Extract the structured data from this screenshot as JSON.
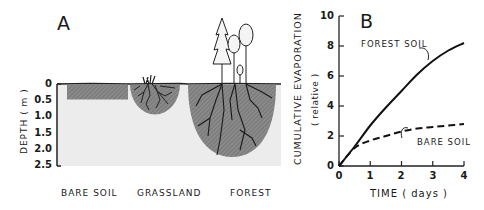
{
  "panel_a": {
    "letter": "A",
    "y_axis_label": "DEPTH",
    "y_axis_unit": "( m )",
    "y_ticks": [
      "0",
      "0.5",
      "1.0",
      "1.5",
      "2.0",
      "2.5"
    ],
    "categories": [
      "BARE SOIL",
      "GRASSLAND",
      "FOREST"
    ],
    "root_depth_m": {
      "BARE SOIL": 0.45,
      "GRASSLAND": 0.9,
      "FOREST": 2.2
    }
  },
  "panel_b": {
    "letter": "B",
    "y_axis_label": "CUMULATIVE EVAPORATION",
    "y_axis_unit": "( relative )",
    "x_axis_label": "TIME ( days )",
    "y_ticks": [
      "0",
      "2",
      "4",
      "6",
      "8",
      "10"
    ],
    "x_ticks": [
      "0",
      "1",
      "2",
      "3",
      "4"
    ],
    "series_labels": [
      "FOREST SOIL",
      "BARE SOIL"
    ]
  },
  "chart_data": [
    {
      "type": "diagram",
      "title": "A",
      "ylabel": "DEPTH (m)",
      "ylim": [
        0,
        2.5
      ],
      "y_ticks": [
        0,
        0.5,
        1.0,
        1.5,
        2.0,
        2.5
      ],
      "categories": [
        "BARE SOIL",
        "GRASSLAND",
        "FOREST"
      ],
      "values": [
        0.45,
        0.9,
        2.2
      ],
      "description": "Depth of soil water extraction zone (shaded) by land cover; roots shown for grassland and forest"
    },
    {
      "type": "line",
      "title": "B",
      "xlabel": "TIME (days)",
      "ylabel": "CUMULATIVE EVAPORATION (relative)",
      "xlim": [
        0,
        4
      ],
      "ylim": [
        0,
        10
      ],
      "x_ticks": [
        0,
        1,
        2,
        3,
        4
      ],
      "y_ticks": [
        0,
        2,
        4,
        6,
        8,
        10
      ],
      "grid": false,
      "series": [
        {
          "name": "FOREST SOIL",
          "style": "solid",
          "x": [
            0,
            0.5,
            1,
            1.5,
            2,
            2.5,
            3,
            3.5,
            4
          ],
          "values": [
            0,
            1.3,
            2.7,
            3.9,
            5.0,
            6.1,
            7.0,
            7.7,
            8.2
          ]
        },
        {
          "name": "BARE SOIL",
          "style": "dashed",
          "x": [
            0,
            0.5,
            1,
            1.5,
            2,
            2.5,
            3,
            3.5,
            4
          ],
          "values": [
            0,
            1.2,
            1.7,
            2.0,
            2.3,
            2.5,
            2.6,
            2.7,
            2.8
          ]
        }
      ]
    }
  ]
}
